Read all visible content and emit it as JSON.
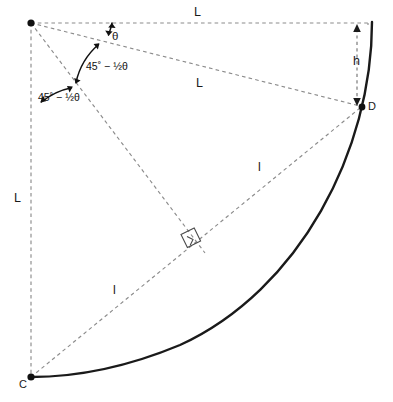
{
  "figure": {
    "type": "geometry-diagram",
    "width": 393,
    "height": 402,
    "background_color": "#ffffff",
    "arc_color": "#1a1a1a",
    "dash_color": "#8c8c8c",
    "angle_arc_color": "#111111",
    "point_color": "#111111"
  },
  "labels": {
    "side_top": "L",
    "side_left": "L",
    "chord_long": "L",
    "chord_upper": "l",
    "chord_lower": "l",
    "height": "h",
    "angle_theta": "θ",
    "angle_half_1": "45˚ − ½θ",
    "angle_half_2": "45˚ − ½θ"
  },
  "points": [
    {
      "name": "apex",
      "label": "",
      "x": 31,
      "y": 23
    },
    {
      "name": "point-d",
      "label": "D",
      "x": 362,
      "y": 107
    },
    {
      "name": "point-c",
      "label": "C",
      "x": 31,
      "y": 377
    }
  ],
  "label_positions": {
    "side_top": {
      "x": 198,
      "y": 13
    },
    "side_left": {
      "x": 18,
      "y": 199
    },
    "chord_long": {
      "x": 200,
      "y": 84
    },
    "chord_upper": {
      "x": 260,
      "y": 168
    },
    "chord_lower": {
      "x": 115,
      "y": 291
    },
    "height": {
      "x": 357,
      "y": 62
    },
    "angle_theta": {
      "x": 117,
      "y": 38
    },
    "angle_half_1": {
      "x": 113,
      "y": 68
    },
    "angle_half_2": {
      "x": 67,
      "y": 99
    },
    "point_d": {
      "x": 370,
      "y": 108
    },
    "point_c": {
      "x": 23,
      "y": 386
    }
  },
  "geometry": {
    "arc_start": {
      "x": 372,
      "y": 22
    },
    "arc_end": {
      "x": 31,
      "y": 377
    },
    "right_angle_marker": {
      "x": 188,
      "y": 240
    },
    "height_arrow": {
      "x": 357,
      "y_top": 25,
      "y_bottom": 105
    }
  }
}
